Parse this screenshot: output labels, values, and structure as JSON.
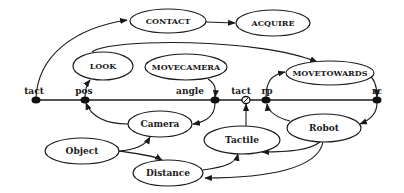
{
  "diagram": {
    "behaviors": {
      "contact": "CONTACT",
      "acquire": "ACQUIRE",
      "look": "LOOK",
      "movecamera": "MOVECAMERA",
      "movetowards": "MOVETOWARDS"
    },
    "resources": {
      "camera": "Camera",
      "tactile": "Tactile",
      "robot": "Robot",
      "object": "Object",
      "distance": "Distance"
    },
    "ports": {
      "tact1": "tact",
      "pos": "pos",
      "angle": "angle",
      "tact2": "tact",
      "rp": "rp",
      "rc": "rc"
    },
    "colors": {
      "ink": "#1a1a1a",
      "background": "#ffffff"
    }
  }
}
